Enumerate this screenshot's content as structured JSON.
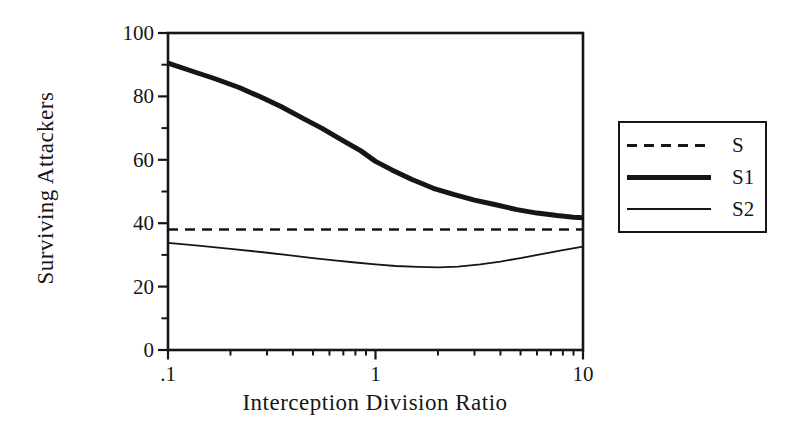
{
  "figure": {
    "background": "#ffffff",
    "ink_color": "#161616"
  },
  "chart_data": {
    "type": "line",
    "title": "",
    "xlabel": "Interception Division Ratio",
    "ylabel": "Surviving Attackers",
    "x_scale": "log",
    "xlim": [
      0.1,
      10
    ],
    "ylim": [
      0,
      100
    ],
    "grid": false,
    "frame": true,
    "x_ticks": {
      "major": [
        {
          "value": 0.1,
          "label": ".1"
        },
        {
          "value": 1,
          "label": "1"
        },
        {
          "value": 10,
          "label": "10"
        }
      ],
      "minor": [
        0.2,
        0.3,
        0.4,
        0.5,
        0.6,
        0.7,
        0.8,
        0.9,
        2,
        3,
        4,
        5,
        6,
        7,
        8,
        9
      ]
    },
    "y_ticks": {
      "major": [
        {
          "value": 0,
          "label": "0"
        },
        {
          "value": 20,
          "label": "20"
        },
        {
          "value": 40,
          "label": "40"
        },
        {
          "value": 60,
          "label": "60"
        },
        {
          "value": 80,
          "label": "80"
        },
        {
          "value": 100,
          "label": "100"
        }
      ],
      "minor": [
        10,
        30,
        50,
        70,
        90
      ]
    },
    "legend": {
      "position": "right-outside",
      "entries": [
        {
          "series": "S",
          "line": "dashed-thin"
        },
        {
          "series": "S1",
          "line": "solid-thick"
        },
        {
          "series": "S2",
          "line": "solid-thin"
        }
      ]
    },
    "series": [
      {
        "name": "S",
        "style": "dashed",
        "stroke_width": 2.4,
        "dash": [
          10,
          7
        ],
        "points": [
          [
            0.1,
            38
          ],
          [
            10,
            38
          ]
        ]
      },
      {
        "name": "S1",
        "style": "solid",
        "stroke_width": 5,
        "points": [
          [
            0.1,
            90.5
          ],
          [
            0.13,
            88
          ],
          [
            0.17,
            85.5
          ],
          [
            0.22,
            82.8
          ],
          [
            0.28,
            79.8
          ],
          [
            0.35,
            76.8
          ],
          [
            0.45,
            73
          ],
          [
            0.55,
            70
          ],
          [
            0.7,
            66
          ],
          [
            0.85,
            62.8
          ],
          [
            1.0,
            59.5
          ],
          [
            1.2,
            56.8
          ],
          [
            1.5,
            53.8
          ],
          [
            1.9,
            51
          ],
          [
            2.4,
            49
          ],
          [
            3.0,
            47.3
          ],
          [
            3.8,
            45.8
          ],
          [
            4.8,
            44.3
          ],
          [
            6.0,
            43.2
          ],
          [
            7.5,
            42.4
          ],
          [
            9.0,
            41.9
          ],
          [
            10,
            41.7
          ]
        ]
      },
      {
        "name": "S2",
        "style": "solid",
        "stroke_width": 1.8,
        "points": [
          [
            0.1,
            33.8
          ],
          [
            0.14,
            32.9
          ],
          [
            0.2,
            31.9
          ],
          [
            0.28,
            30.9
          ],
          [
            0.38,
            29.9
          ],
          [
            0.5,
            29
          ],
          [
            0.65,
            28.2
          ],
          [
            0.8,
            27.6
          ],
          [
            1.0,
            27
          ],
          [
            1.25,
            26.5
          ],
          [
            1.6,
            26.2
          ],
          [
            2.0,
            26.1
          ],
          [
            2.5,
            26.3
          ],
          [
            3.2,
            27
          ],
          [
            4.0,
            27.9
          ],
          [
            5.0,
            29
          ],
          [
            6.5,
            30.4
          ],
          [
            8.0,
            31.5
          ],
          [
            10,
            32.6
          ]
        ]
      }
    ]
  }
}
